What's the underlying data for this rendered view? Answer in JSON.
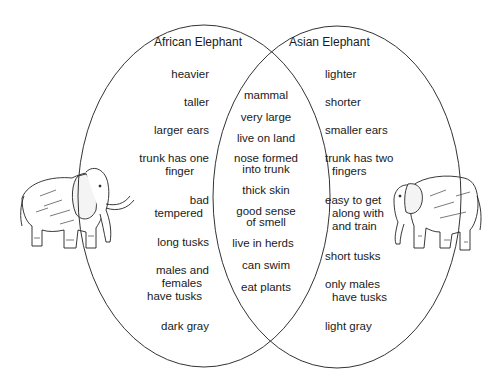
{
  "diagram": {
    "type": "venn",
    "sets": [
      {
        "title": "African Elephant",
        "unique_traits": [
          "heavier",
          "taller",
          "larger ears",
          "trunk has one finger",
          "bad tempered",
          "long tusks",
          "males and females have tusks",
          "dark gray"
        ]
      },
      {
        "title": "Asian Elephant",
        "unique_traits": [
          "lighter",
          "shorter",
          "smaller ears",
          "trunk has two fingers",
          "easy to get along with and train",
          "short tusks",
          "only males have tusks",
          "light gray"
        ]
      }
    ],
    "shared_traits": [
      "mammal",
      "very large",
      "live on land",
      "nose formed into trunk",
      "thick skin",
      "good sense of smell",
      "live in herds",
      "can swim",
      "eat plants"
    ],
    "illustrations": {
      "left": "african-elephant-drawing",
      "right": "asian-elephant-drawing"
    }
  },
  "labels": {
    "african_title": "African Elephant",
    "asian_title": "Asian Elephant",
    "left": {
      "l0": "heavier",
      "l1": "taller",
      "l2": "larger ears",
      "l3a": "trunk has one",
      "l3b": "finger",
      "l4a": "bad",
      "l4b": "tempered",
      "l5": "long tusks",
      "l6a": "males and",
      "l6b": "females",
      "l6c": "have tusks",
      "l7": "dark gray"
    },
    "right": {
      "r0": "lighter",
      "r1": "shorter",
      "r2": "smaller ears",
      "r3a": "trunk has two",
      "r3b": "fingers",
      "r4a": "easy to get",
      "r4b": "along with",
      "r4c": "and train",
      "r5": "short tusks",
      "r6a": "only males",
      "r6b": "have tusks",
      "r7": "light gray"
    },
    "center": {
      "c0": "mammal",
      "c1": "very large",
      "c2": "live on land",
      "c3a": "nose formed",
      "c3b": "into trunk",
      "c4": "thick skin",
      "c5a": "good sense",
      "c5b": "of smell",
      "c6": "live in herds",
      "c7": "can swim",
      "c8": "eat plants"
    }
  },
  "colors": {
    "outline": "#333333",
    "text": "#1a1a1a",
    "background": "#ffffff"
  }
}
